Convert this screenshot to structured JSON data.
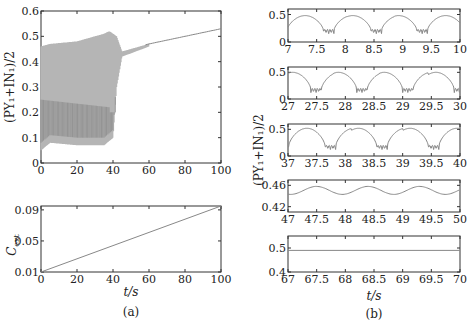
{
  "chart_data": [
    {
      "id": "a-top",
      "type": "line",
      "title": "",
      "xlabel": "",
      "ylabel": "(PY1+IN1)/2",
      "xlim": [
        0,
        100
      ],
      "ylim": [
        0,
        0.6
      ],
      "xticks": [
        "0",
        "20",
        "40",
        "60",
        "80",
        "100"
      ],
      "yticks": [
        "0",
        "0.1",
        "0.2",
        "0.3",
        "0.4",
        "0.5",
        "0.6"
      ],
      "description": "Dense oscillation band: t 0-42 lower envelope ~0.05-0.1, upper ~0.46-0.52; t 42-60 narrow band ~0.43-0.47; t>60 single smooth curve rising to ~0.53 at t=100",
      "upper_envelope": {
        "x": [
          0,
          5,
          20,
          35,
          38,
          42,
          45,
          60,
          80,
          100
        ],
        "y": [
          0.46,
          0.47,
          0.48,
          0.51,
          0.52,
          0.5,
          0.44,
          0.47,
          0.5,
          0.53
        ]
      },
      "lower_envelope": {
        "x": [
          0,
          5,
          20,
          35,
          40,
          42,
          45,
          60,
          80,
          100
        ],
        "y": [
          0.05,
          0.08,
          0.07,
          0.07,
          0.1,
          0.3,
          0.42,
          0.46,
          0.5,
          0.53
        ]
      }
    },
    {
      "id": "a-bottom",
      "type": "line",
      "xlabel": "t/s",
      "ylabel": "C_ext",
      "xlim": [
        0,
        100
      ],
      "ylim": [
        0.01,
        0.095
      ],
      "xticks": [
        "0",
        "20",
        "40",
        "60",
        "80",
        "100"
      ],
      "yticks": [
        "0.01",
        "0.05",
        "0.09"
      ],
      "x": [
        0,
        100
      ],
      "y": [
        0.01,
        0.095
      ]
    },
    {
      "id": "b-1",
      "type": "line",
      "xlim": [
        7,
        10
      ],
      "ylim": [
        0,
        0.6
      ],
      "xticks": [
        "7",
        "7.5",
        "8",
        "8.5",
        "9",
        "9.5",
        "10"
      ],
      "yticks": [
        "0",
        "0.5"
      ],
      "description": "Periodic arches peaking ~0.48 with burst of small oscillations near 0.1-0.2 around t=7.6, 8.45, 9.25"
    },
    {
      "id": "b-2",
      "type": "line",
      "xlim": [
        27,
        30
      ],
      "ylim": [
        0,
        0.6
      ],
      "xticks": [
        "27",
        "27.5",
        "28",
        "28.5",
        "29",
        "29.5",
        "30"
      ],
      "yticks": [
        "0",
        "0.5"
      ],
      "description": "Arches peaking ~0.5, bursts at ~27.4, 28.2, 29.0, 29.9"
    },
    {
      "id": "b-3",
      "type": "line",
      "xlim": [
        37,
        40
      ],
      "ylim": [
        0,
        0.6
      ],
      "xticks": [
        "37",
        "37.5",
        "38",
        "38.5",
        "39",
        "39.5",
        "40"
      ],
      "yticks": [
        "0",
        "0.5"
      ],
      "description": "Arches peaking ~0.52, dips to ~0.12 at ~37.65, 38.55, 39.45"
    },
    {
      "id": "b-4",
      "type": "line",
      "xlim": [
        47,
        50
      ],
      "ylim": [
        0.41,
        0.47
      ],
      "xticks": [
        "47",
        "47.5",
        "48",
        "48.5",
        "49",
        "49.5",
        "50"
      ],
      "yticks": [
        "0.42",
        "0.46"
      ],
      "description": "Small oscillation between ~0.443 and ~0.458"
    },
    {
      "id": "b-5",
      "type": "line",
      "xlim": [
        67,
        70
      ],
      "ylim": [
        0.4,
        0.55
      ],
      "xticks": [
        "67",
        "67.5",
        "68",
        "68.5",
        "69",
        "69.5",
        "70"
      ],
      "yticks": [
        "0.4",
        "0.5"
      ],
      "x": [
        67,
        70
      ],
      "y": [
        0.49,
        0.49
      ],
      "xlabel": "t/s"
    }
  ],
  "labels": {
    "a_ylabel": "(PY₁+IN₁)/2",
    "a_bottom_ylabel": "C",
    "a_bottom_ylabel_sub": "ext",
    "xlabel": "t/s",
    "b_ylabel": "(PY₁+IN₁)/2",
    "caption_a": "(a)",
    "caption_b": "(b)"
  },
  "colors": {
    "line": "#888888",
    "band_light": "#b5b5b5",
    "band_dark": "#8c8c8c",
    "axis": "#333333"
  }
}
